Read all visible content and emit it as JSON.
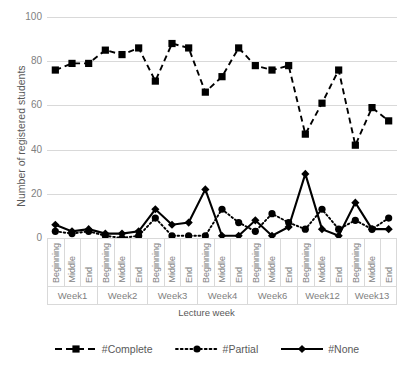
{
  "chart_data": {
    "type": "line",
    "title": "",
    "xlabel": "Lecture week",
    "ylabel": "Number of registered students",
    "ylim": [
      0,
      100
    ],
    "yticks": [
      0,
      20,
      40,
      60,
      80,
      100
    ],
    "grid": true,
    "legend_position": "bottom",
    "groups": [
      "Week1",
      "Week2",
      "Week3",
      "Week4",
      "Week6",
      "Week12",
      "Week13"
    ],
    "positions": [
      "Beginning",
      "Middle",
      "End"
    ],
    "categories": [
      "Week1 Beginning",
      "Week1 Middle",
      "Week1 End",
      "Week2 Beginning",
      "Week2 Middle",
      "Week2 End",
      "Week3 Beginning",
      "Week3 Middle",
      "Week3 End",
      "Week4 Beginning",
      "Week4 Middle",
      "Week4 End",
      "Week6 Beginning",
      "Week6 Middle",
      "Week6 End",
      "Week12 Beginning",
      "Week12 Middle",
      "Week12 End",
      "Week13 Beginning",
      "Week13 Middle",
      "Week13 End"
    ],
    "series": [
      {
        "name": "#Complete",
        "marker": "square",
        "linestyle": "dashed",
        "color": "#000000",
        "values": [
          76,
          79,
          79,
          85,
          83,
          86,
          71,
          88,
          86,
          66,
          73,
          86,
          78,
          76,
          78,
          47,
          61,
          76,
          42,
          59,
          53
        ]
      },
      {
        "name": "#Partial",
        "marker": "circle",
        "linestyle": "dotted",
        "color": "#000000",
        "values": [
          3,
          2,
          3,
          1,
          0,
          1,
          9,
          1,
          1,
          1,
          13,
          7,
          3,
          11,
          7,
          4,
          13,
          4,
          8,
          4,
          9
        ]
      },
      {
        "name": "#None",
        "marker": "diamond",
        "linestyle": "solid",
        "color": "#000000",
        "values": [
          6,
          3,
          4,
          2,
          2,
          3,
          13,
          6,
          7,
          22,
          1,
          1,
          8,
          1,
          5,
          29,
          4,
          1,
          16,
          4,
          4
        ]
      }
    ]
  },
  "axis": {
    "y_title": "Number of registered students",
    "x_title": "Lecture week"
  }
}
